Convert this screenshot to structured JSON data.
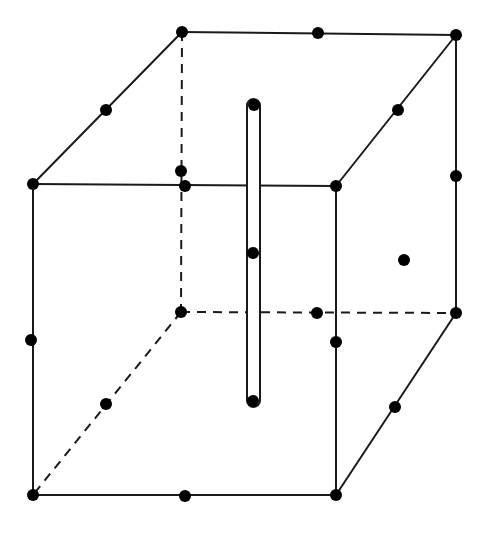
{
  "diagram": {
    "title": "",
    "kind": "cubic unit cell with lattice points and central rod",
    "canvas": {
      "width": 485,
      "height": 533,
      "background": "#ffffff"
    },
    "colors": {
      "stroke": "#1a1a1a",
      "point": "#000000"
    },
    "stroke_width": 2,
    "point_radius": 6,
    "dash_pattern": "9,7",
    "vertices": {
      "front_top_left": [
        33,
        184
      ],
      "front_top_right": [
        336,
        186
      ],
      "front_bottom_left": [
        33,
        495
      ],
      "front_bottom_right": [
        336,
        495
      ],
      "back_top_left": [
        182,
        32
      ],
      "back_top_right": [
        456,
        35
      ],
      "back_bottom_left": [
        181,
        312
      ],
      "back_bottom_right": [
        456,
        313
      ]
    },
    "solid_edges": [
      [
        "front_top_left",
        "front_top_right"
      ],
      [
        "front_top_right",
        "front_bottom_right"
      ],
      [
        "front_bottom_right",
        "front_bottom_left"
      ],
      [
        "front_bottom_left",
        "front_top_left"
      ],
      [
        "front_top_left",
        "back_top_left"
      ],
      [
        "back_top_left",
        "back_top_right"
      ],
      [
        "back_top_right",
        "front_top_right"
      ],
      [
        "back_top_right",
        "back_bottom_right"
      ],
      [
        "back_bottom_right",
        "front_bottom_right"
      ]
    ],
    "dashed_edges": [
      [
        "back_top_left",
        "back_bottom_left"
      ],
      [
        "back_bottom_left",
        "back_bottom_right"
      ],
      [
        "back_bottom_left",
        "front_bottom_left"
      ]
    ],
    "points": [
      {
        "name": "corner-front-top-left",
        "xy": [
          33,
          184
        ]
      },
      {
        "name": "corner-front-top-right",
        "xy": [
          336,
          186
        ]
      },
      {
        "name": "corner-front-bottom-left",
        "xy": [
          33,
          495
        ]
      },
      {
        "name": "corner-front-bottom-right",
        "xy": [
          336,
          495
        ]
      },
      {
        "name": "corner-back-top-left",
        "xy": [
          182,
          32
        ]
      },
      {
        "name": "corner-back-top-right",
        "xy": [
          456,
          35
        ]
      },
      {
        "name": "corner-back-bottom-left",
        "xy": [
          181,
          312
        ]
      },
      {
        "name": "corner-back-bottom-right",
        "xy": [
          456,
          313
        ]
      },
      {
        "name": "edge-mid-top-left-diagonal",
        "xy": [
          106,
          110
        ]
      },
      {
        "name": "edge-mid-top-back",
        "xy": [
          318,
          33
        ]
      },
      {
        "name": "edge-mid-top-right-diagonal",
        "xy": [
          398,
          110
        ]
      },
      {
        "name": "edge-mid-back-right-vertical",
        "xy": [
          456,
          176
        ]
      },
      {
        "name": "edge-mid-back-left-vertical",
        "xy": [
          181,
          171
        ]
      },
      {
        "name": "edge-mid-front-top",
        "xy": [
          185,
          186
        ]
      },
      {
        "name": "edge-mid-front-left-vertical",
        "xy": [
          31,
          340
        ]
      },
      {
        "name": "edge-mid-front-right-vertical",
        "xy": [
          336,
          342
        ]
      },
      {
        "name": "edge-mid-back-bottom",
        "xy": [
          317,
          313
        ]
      },
      {
        "name": "edge-mid-bottom-left-diagonal",
        "xy": [
          106,
          404
        ]
      },
      {
        "name": "edge-mid-bottom-right-diagonal",
        "xy": [
          395,
          407
        ]
      },
      {
        "name": "edge-mid-front-bottom",
        "xy": [
          185,
          496
        ]
      },
      {
        "name": "face-center-right",
        "xy": [
          404,
          260
        ]
      },
      {
        "name": "rod-top",
        "xy": [
          254,
          105
        ]
      },
      {
        "name": "rod-center",
        "xy": [
          253,
          253
        ]
      },
      {
        "name": "rod-bottom",
        "xy": [
          253,
          401
        ]
      }
    ],
    "rod": {
      "x": 247,
      "y": 99,
      "width": 13,
      "height": 308,
      "rx": 6.5
    }
  }
}
